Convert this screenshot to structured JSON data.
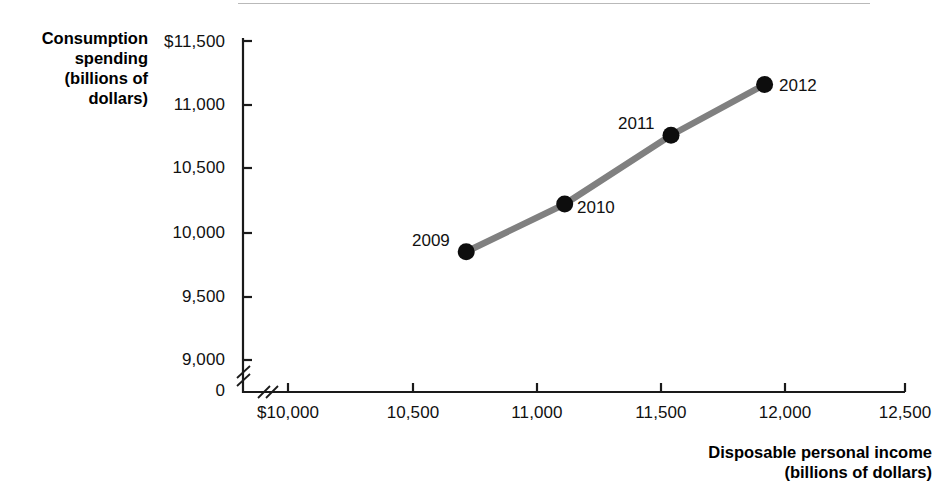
{
  "chart_data": {
    "type": "line",
    "title": "",
    "subtitle": "",
    "xlabel": "Disposable personal income",
    "xlabel_units": "(billions of dollars)",
    "ylabel": "Consumption spending",
    "ylabel_units_1": "(billions of",
    "ylabel_units_2": "dollars)",
    "xlim": [
      10000,
      12500
    ],
    "ylim": [
      9000,
      11500
    ],
    "xticks": [
      10000,
      10500,
      11000,
      11500,
      12000,
      12500
    ],
    "xtick_labels": [
      "$10,000",
      "10,500",
      "11,000",
      "11,500",
      "12,000",
      "12,500"
    ],
    "yticks": [
      9000,
      9500,
      10000,
      10500,
      11000,
      11500
    ],
    "ytick_labels": [
      "9,000",
      "9,500",
      "10,000",
      "10,500",
      "11,000",
      "$11,500"
    ],
    "y_origin_label": "0",
    "axis_break_x": true,
    "axis_break_y": true,
    "grid": false,
    "legend": "none",
    "line_color": "#808080",
    "marker_color": "#0d0d0d",
    "series": [
      {
        "name": "Consumption vs disposable income",
        "points": [
          {
            "label": "2009",
            "x": 10722,
            "y": 9849,
            "label_pos": "left"
          },
          {
            "label": "2010",
            "x": 11121,
            "y": 10222,
            "label_pos": "right-below"
          },
          {
            "label": "2011",
            "x": 11552,
            "y": 10762,
            "label_pos": "left-above"
          },
          {
            "label": "2012",
            "x": 11931,
            "y": 11159,
            "label_pos": "right"
          }
        ]
      }
    ]
  },
  "axis_titles": {
    "y_line1": "Consumption",
    "y_line2": "spending",
    "y_line3": "(billions of",
    "y_line4": "dollars)",
    "x_line1": "Disposable personal income",
    "x_line2": "(billions of dollars)"
  },
  "ticks": {
    "y": [
      {
        "label": "$11,500",
        "top": 32
      },
      {
        "label": "11,000",
        "top": 95
      },
      {
        "label": "10,500",
        "top": 158
      },
      {
        "label": "10,000",
        "top": 223
      },
      {
        "label": "9,500",
        "top": 287
      },
      {
        "label": "9,000",
        "top": 350
      },
      {
        "label": "0",
        "top": 380
      }
    ],
    "x": [
      {
        "label": "$10,000",
        "left": 288
      },
      {
        "label": "10,500",
        "left": 413
      },
      {
        "label": "11,000",
        "left": 537
      },
      {
        "label": "11,500",
        "left": 661
      },
      {
        "label": "12,000",
        "left": 785
      },
      {
        "label": "12,500",
        "left": 905
      }
    ]
  },
  "point_labels": [
    {
      "text": "2009",
      "left": 412,
      "top": 231
    },
    {
      "text": "2010",
      "left": 577,
      "top": 198
    },
    {
      "text": "2011",
      "left": 618,
      "top": 114
    },
    {
      "text": "2012",
      "left": 779,
      "top": 76
    }
  ]
}
